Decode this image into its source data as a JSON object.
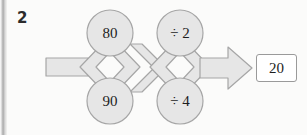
{
  "page": {
    "background_color": "#fbfbfa",
    "width": 307,
    "height": 135
  },
  "question": {
    "number": "2"
  },
  "diagram": {
    "type": "function-machine-chain",
    "shape_fill_color": "#e6e6e6",
    "shape_stroke_color": "#a6a6a6",
    "stage_one": {
      "label": "input-numbers",
      "options": [
        {
          "id": "top",
          "label": "80"
        },
        {
          "id": "bottom",
          "label": "90"
        }
      ]
    },
    "stage_two": {
      "label": "operations",
      "options": [
        {
          "id": "top",
          "label": "÷ 2"
        },
        {
          "id": "bottom",
          "label": "÷ 4"
        }
      ]
    },
    "output_arrow": {
      "name": "output-arrow",
      "direction": "right"
    }
  },
  "answer": {
    "value": "20",
    "border_color": "#9a9a9a",
    "fill_color": "#ffffff"
  }
}
